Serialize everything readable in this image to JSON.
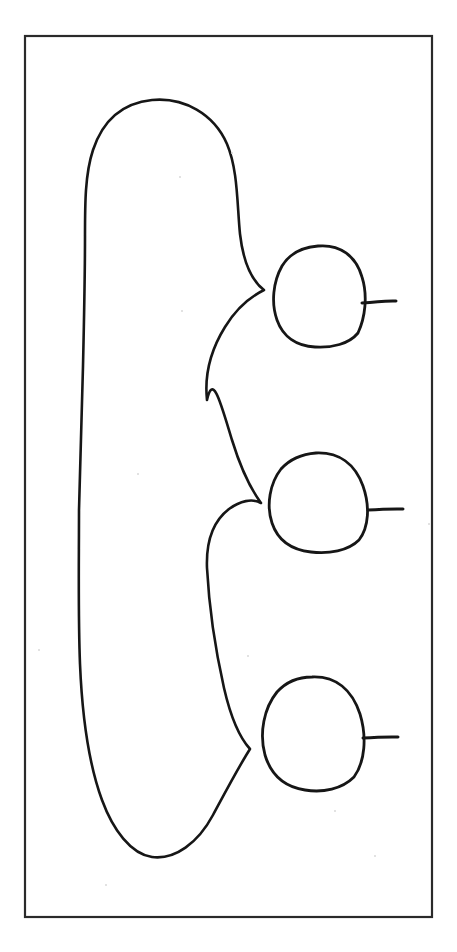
{
  "document": {
    "title": "Hand-drawn topological diagram",
    "background_color": "#ffffff",
    "ink_color": "#161616",
    "frame_color": "#2a2a2a",
    "width": 457,
    "height": 952,
    "caption": ""
  },
  "frame": {
    "name": "border-rectangle",
    "x": 25,
    "y": 36,
    "width": 407,
    "height": 881,
    "stroke_width": 2.2
  },
  "figure": {
    "type": "line-drawing",
    "stroke_width": 2.6,
    "large_shape": {
      "name": "main-blob",
      "label": "",
      "top_y": 100,
      "bottom_y": 858,
      "left_x": 79,
      "right_extent_x": 265,
      "path": "M 150 101 C 120 104 99 126 89 162 C 82 190 85 228 85 262 C 85 330 84 400 82 470 C 80 545 79 620 81 690 C 83 744 89 790 106 820 C 121 846 140 860 157 858 C 180 856 199 840 214 812 C 228 786 240 766 252 748 C 243 740 234 720 228 694 C 218 650 211 600 208 560 C 207 535 210 518 228 506 C 241 497 252 494 262 503 C 251 488 241 466 233 440 C 223 408 207 378 204 400 C 208 378 214 358 226 336 C 238 314 251 300 265 290 C 252 280 243 258 240 232 C 237 203 238 172 227 146 C 214 116 186 98 150 101 Z"
    },
    "cusps": [
      {
        "name": "cusp-upper",
        "x": 265,
        "y": 290
      },
      {
        "name": "cusp-middle",
        "x": 262,
        "y": 503
      },
      {
        "name": "cusp-lower",
        "x": 252,
        "y": 748
      }
    ],
    "circles": [
      {
        "name": "circle-upper",
        "label": "",
        "cx": 318,
        "cy": 296,
        "rx": 45,
        "ry": 51,
        "tail": {
          "name": "tail-upper",
          "x1": 362,
          "y1": 303,
          "x2": 396,
          "y2": 301
        }
      },
      {
        "name": "circle-middle",
        "label": "",
        "cx": 319,
        "cy": 503,
        "rx": 49,
        "ry": 50,
        "tail": {
          "name": "tail-middle",
          "x1": 368,
          "y1": 510,
          "x2": 403,
          "y2": 509
        }
      },
      {
        "name": "circle-lower",
        "label": "",
        "cx": 313,
        "cy": 733,
        "rx": 50,
        "ry": 57,
        "tail": {
          "name": "tail-lower",
          "x1": 363,
          "y1": 738,
          "x2": 398,
          "y2": 737
        }
      }
    ]
  },
  "specks": [
    {
      "x": 179,
      "y": 176
    },
    {
      "x": 231,
      "y": 152
    },
    {
      "x": 181,
      "y": 310
    },
    {
      "x": 137,
      "y": 473
    },
    {
      "x": 38,
      "y": 649
    },
    {
      "x": 247,
      "y": 655
    },
    {
      "x": 334,
      "y": 810
    },
    {
      "x": 105,
      "y": 884
    },
    {
      "x": 374,
      "y": 855
    },
    {
      "x": 428,
      "y": 523
    }
  ]
}
